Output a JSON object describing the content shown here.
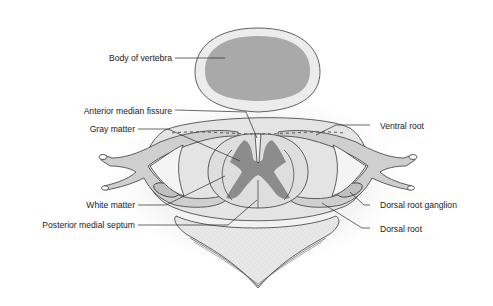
{
  "figure": {
    "colors": {
      "background": "#ffffff",
      "vertebra_body_outer": "#e6e6e6",
      "vertebra_body_inner": "#a9a9a9",
      "white_matter": "#dcdcdc",
      "gray_matter": "#8c8c8c",
      "nerve_root": "#c8c8c8",
      "outline": "#3a3a3a",
      "text": "#1a1a1a"
    }
  },
  "labels": {
    "body_of_vertebra": "Body of vertebra",
    "anterior_median_fissure": "Anterior median fissure",
    "gray_matter": "Gray matter",
    "ventral_root": "Ventral root",
    "white_matter": "White matter",
    "dorsal_root_ganglion": "Dorsal root ganglion",
    "posterior_medial_septum": "Posterior medial septum",
    "dorsal_root": "Dorsal root"
  }
}
